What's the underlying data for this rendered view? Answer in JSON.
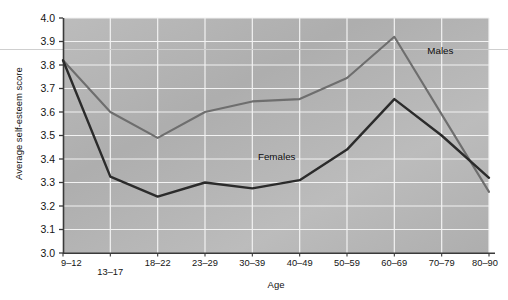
{
  "chart_data": {
    "type": "line",
    "title": "",
    "xlabel": "Age",
    "ylabel": "Average self-esteem score",
    "categories": [
      "9–12",
      "13–17",
      "18–22",
      "23–29",
      "30–39",
      "40–49",
      "50–59",
      "60–69",
      "70–79",
      "80–90"
    ],
    "ylim": [
      3.0,
      4.0
    ],
    "ytick_step": 0.1,
    "yticks": [
      "3.0",
      "3.1",
      "3.2",
      "3.3",
      "3.4",
      "3.5",
      "3.6",
      "3.7",
      "3.8",
      "3.9",
      "4.0"
    ],
    "grid": true,
    "legend_position": "inline-annotation",
    "series": [
      {
        "name": "Males",
        "color": "#6e6e6e",
        "values": [
          3.82,
          3.6,
          3.49,
          3.6,
          3.645,
          3.655,
          3.745,
          3.92,
          3.59,
          3.26
        ]
      },
      {
        "name": "Females",
        "color": "#2b2b2b",
        "values": [
          3.82,
          3.325,
          3.24,
          3.3,
          3.275,
          3.31,
          3.44,
          3.655,
          3.5,
          3.32
        ]
      }
    ],
    "annotations": [
      {
        "text": "Males",
        "x_category": "60–69",
        "value": 3.86
      },
      {
        "text": "Females",
        "x_category": "40–49",
        "value": 3.41
      }
    ],
    "plot_background": "#b8b8b8",
    "grid_color": "#f2f2f2",
    "axis_color": "#3a3a3a",
    "figure_background": "#ffffff"
  }
}
